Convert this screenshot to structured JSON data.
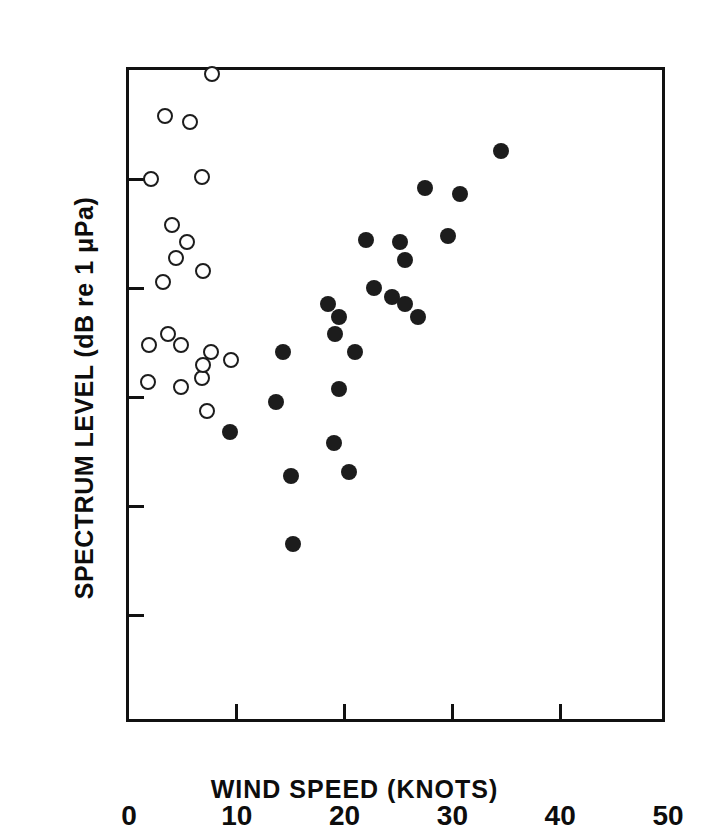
{
  "chart_data": {
    "type": "scatter",
    "title": "",
    "xlabel": "WIND SPEED (KNOTS)",
    "ylabel": "SPECTRUM LEVEL (dB re 1 μPa)",
    "xlim": [
      0,
      50
    ],
    "ylim": [
      50,
      80
    ],
    "xticks": [
      0,
      10,
      20,
      30,
      40,
      50
    ],
    "xtick_labels": [
      "0",
      "10",
      "20",
      "30",
      "40",
      "50"
    ],
    "yticks": [
      50,
      55,
      60,
      65,
      70,
      75,
      80
    ],
    "ytick_labels": [
      "50",
      "",
      "60",
      "",
      "70",
      "",
      "80"
    ],
    "grid": false,
    "legend": "none",
    "series": [
      {
        "name": "open-circles",
        "marker": "open circle",
        "color": "#1c1c1c",
        "points": [
          [
            1.8,
            65.7
          ],
          [
            1.9,
            67.4
          ],
          [
            2.0,
            75.0
          ],
          [
            3.2,
            70.3
          ],
          [
            3.3,
            77.9
          ],
          [
            3.6,
            67.9
          ],
          [
            4.0,
            72.9
          ],
          [
            4.4,
            71.4
          ],
          [
            4.8,
            65.5
          ],
          [
            4.8,
            67.4
          ],
          [
            5.4,
            72.1
          ],
          [
            5.7,
            77.6
          ],
          [
            6.8,
            65.9
          ],
          [
            6.8,
            75.1
          ],
          [
            6.9,
            66.5
          ],
          [
            6.9,
            70.8
          ],
          [
            7.2,
            64.4
          ],
          [
            7.6,
            67.1
          ],
          [
            7.7,
            79.8
          ],
          [
            9.5,
            66.7
          ]
        ]
      },
      {
        "name": "filled-circles",
        "marker": "filled circle",
        "color": "#1c1c1c",
        "points": [
          [
            9.4,
            63.4
          ],
          [
            13.6,
            64.8
          ],
          [
            14.3,
            67.1
          ],
          [
            15.0,
            61.4
          ],
          [
            15.2,
            58.3
          ],
          [
            19.0,
            62.9
          ],
          [
            18.5,
            69.3
          ],
          [
            19.1,
            67.9
          ],
          [
            19.5,
            65.4
          ],
          [
            19.5,
            68.7
          ],
          [
            20.4,
            61.6
          ],
          [
            21.0,
            67.1
          ],
          [
            22.0,
            72.2
          ],
          [
            22.7,
            70.0
          ],
          [
            24.4,
            69.6
          ],
          [
            25.1,
            72.1
          ],
          [
            25.6,
            69.3
          ],
          [
            25.6,
            71.3
          ],
          [
            26.8,
            68.7
          ],
          [
            27.5,
            74.6
          ],
          [
            29.6,
            72.4
          ],
          [
            30.7,
            74.3
          ],
          [
            34.5,
            76.3
          ]
        ]
      }
    ]
  },
  "axis": {
    "y_title_text": "SPECTRUM LEVEL (dB re 1 μPa)",
    "x_title_text": "WIND SPEED (KNOTS)"
  }
}
